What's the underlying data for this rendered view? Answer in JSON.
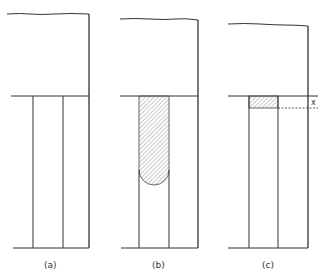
{
  "colors": {
    "line": "#333333",
    "hatch": "#777777",
    "background": "#ffffff"
  },
  "panels": [
    {
      "id": "a",
      "label": "(a)",
      "fill": "none"
    },
    {
      "id": "b",
      "label": "(b)",
      "fill": "hatched column with rounded bottom"
    },
    {
      "id": "c",
      "label": "(c)",
      "fill": "thin hatched layer of thickness x"
    }
  ],
  "annotations": {
    "thickness_label": "x"
  }
}
